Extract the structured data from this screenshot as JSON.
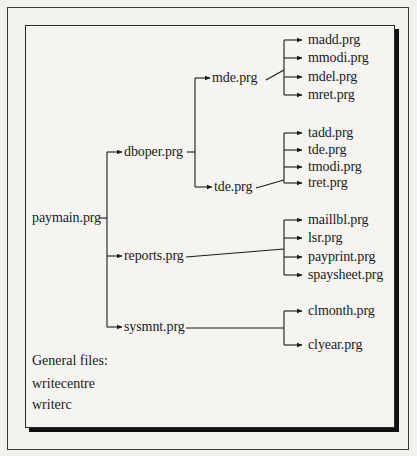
{
  "diagram": {
    "type": "program-hierarchy",
    "root": {
      "label": "paymain.prg",
      "children": [
        {
          "label": "dboper.prg",
          "children": [
            {
              "label": "mde.prg",
              "children": [
                {
                  "label": "madd.prg"
                },
                {
                  "label": "mmodi.prg"
                },
                {
                  "label": "mdel.prg"
                },
                {
                  "label": "mret.prg"
                }
              ]
            },
            {
              "label": "tde.prg",
              "children": [
                {
                  "label": "tadd.prg"
                },
                {
                  "label": "tde.prg"
                },
                {
                  "label": "tmodi.prg"
                },
                {
                  "label": "tret.prg"
                }
              ]
            }
          ]
        },
        {
          "label": "reports.prg",
          "children": [
            {
              "label": "maillbl.prg"
            },
            {
              "label": "lsr.prg"
            },
            {
              "label": "payprint.prg"
            },
            {
              "label": "spaysheet.prg"
            }
          ]
        },
        {
          "label": "sysmnt.prg",
          "children": [
            {
              "label": "clmonth.prg"
            },
            {
              "label": "clyear.prg"
            }
          ]
        }
      ]
    },
    "general_files": {
      "heading": "General files:",
      "items": [
        "writecentre",
        "writerc"
      ]
    }
  },
  "colors": {
    "line": "#1a1a1a",
    "background": "#f3f2ef",
    "shadow": "#111111"
  }
}
